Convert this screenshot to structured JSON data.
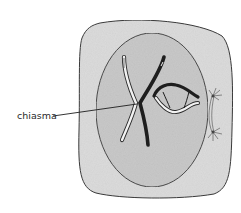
{
  "diagram": {
    "labels": [
      {
        "id": "chiasma",
        "text": "chiasma"
      }
    ],
    "colors": {
      "cytoplasm": "#dcdcdc",
      "nucleus": "#c9c9c9",
      "outline": "#3a3a3a",
      "dark_chromatid": "#1e1e1e",
      "light_chromatid": "#f2f2f2"
    },
    "parts": [
      "cell membrane",
      "nucleus",
      "crossed homologous chromosomes (chiasma)",
      "bivalent with two chiasmata",
      "centrioles with asters and spindle"
    ]
  }
}
